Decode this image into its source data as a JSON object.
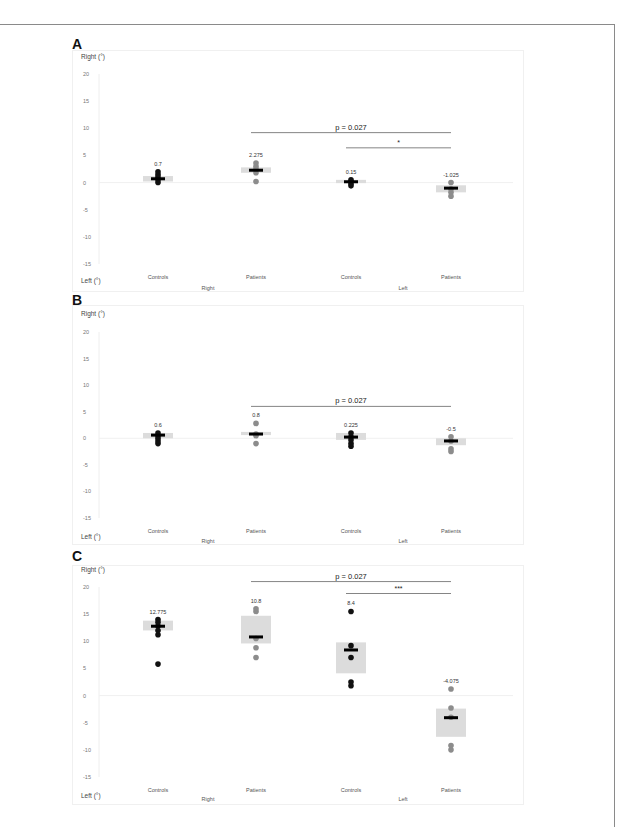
{
  "figure": {
    "panels": [
      "A",
      "B",
      "C"
    ],
    "caption_visible": "(caption cut off at bottom edge)"
  },
  "chart_data": [
    {
      "panel": "A",
      "type": "scatter",
      "title": "",
      "ylabel_top": "Right (°)",
      "ylabel_bottom": "Left (°)",
      "yticks": [
        20,
        15,
        10,
        5,
        0,
        -5,
        -10,
        -15
      ],
      "ylim": [
        -15,
        20
      ],
      "categories": [
        "Controls",
        "Patients",
        "Controls",
        "Patients"
      ],
      "groups": [
        "Right",
        "Left"
      ],
      "medians": [
        0.7,
        2.275,
        0.15,
        -1.025
      ],
      "median_labels": [
        "0.7",
        "2.275",
        "0.15",
        "-1.025"
      ],
      "iqr": [
        [
          0.2,
          1.2
        ],
        [
          1.8,
          2.8
        ],
        [
          -0.1,
          0.5
        ],
        [
          -1.8,
          -0.5
        ]
      ],
      "points": [
        [
          0,
          0.5,
          1,
          1.5,
          2
        ],
        [
          0.2,
          1.8,
          2.5,
          3,
          3.6
        ],
        [
          -0.6,
          -0.2,
          0.2,
          0.5
        ],
        [
          -2.5,
          -1.8,
          -1.2,
          0
        ]
      ],
      "point_colors": [
        "#111111",
        "#8c8c8c",
        "#111111",
        "#8c8c8c"
      ],
      "annotations": [
        {
          "text": "p = 0.027",
          "from": 1,
          "to": 3,
          "y": 9.2
        },
        {
          "text": "*",
          "from": 2,
          "to": 3,
          "y": 6.4
        }
      ]
    },
    {
      "panel": "B",
      "type": "scatter",
      "title": "",
      "ylabel_top": "Right (°)",
      "ylabel_bottom": "Left (°)",
      "yticks": [
        20,
        15,
        10,
        5,
        0,
        -5,
        -10,
        -15
      ],
      "ylim": [
        -15,
        20
      ],
      "categories": [
        "Controls",
        "Patients",
        "Controls",
        "Patients"
      ],
      "groups": [
        "Right",
        "Left"
      ],
      "medians": [
        0.6,
        0.8,
        0.225,
        -0.5
      ],
      "median_labels": [
        "0.6",
        "0.8",
        "0.225",
        "-0.5"
      ],
      "iqr": [
        [
          0,
          1
        ],
        [
          0.6,
          1.2
        ],
        [
          -0.3,
          1.0
        ],
        [
          -1.3,
          0
        ]
      ],
      "points": [
        [
          -1,
          -0.5,
          0,
          0.5,
          1
        ],
        [
          -1,
          0.5,
          0.8,
          2.8
        ],
        [
          -1.5,
          -1,
          -0.3,
          0.3,
          1
        ],
        [
          -2.5,
          -2,
          -0.5,
          0.3
        ]
      ],
      "point_colors": [
        "#111111",
        "#8c8c8c",
        "#111111",
        "#8c8c8c"
      ],
      "annotations": [
        {
          "text": "p = 0.027",
          "from": 1,
          "to": 3,
          "y": 6
        }
      ]
    },
    {
      "panel": "C",
      "type": "scatter",
      "title": "",
      "ylabel_top": "Right (°)",
      "ylabel_bottom": "Left (°)",
      "yticks": [
        20,
        15,
        10,
        5,
        0,
        -5,
        -10,
        -15
      ],
      "ylim": [
        -15,
        20
      ],
      "categories": [
        "Controls",
        "Patients",
        "Controls",
        "Patients"
      ],
      "groups": [
        "Right",
        "Left"
      ],
      "medians": [
        12.775,
        10.8,
        8.4,
        -4.075
      ],
      "median_labels": [
        "12.775",
        "10.8",
        "8.4",
        "-4.075"
      ],
      "iqr": [
        [
          12,
          13.8
        ],
        [
          9.6,
          14.7
        ],
        [
          4.1,
          9.8
        ],
        [
          -7.6,
          -2.4
        ]
      ],
      "points": [
        [
          5.8,
          11.2,
          12,
          12.8,
          13.5,
          14
        ],
        [
          7,
          8.8,
          10.5,
          15.5,
          16
        ],
        [
          1.8,
          2.5,
          7,
          9.2,
          15.5
        ],
        [
          -10,
          -9.2,
          -4,
          -2.3,
          1.2
        ]
      ],
      "point_colors": [
        "#111111",
        "#8c8c8c",
        "#111111",
        "#8c8c8c"
      ],
      "annotations": [
        {
          "text": "p = 0.027",
          "from": 1,
          "to": 3,
          "y": 21
        },
        {
          "text": "***",
          "from": 2,
          "to": 3,
          "y": 18.8
        }
      ]
    }
  ]
}
